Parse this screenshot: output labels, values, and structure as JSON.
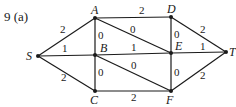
{
  "problem": {
    "label": "9  (a)"
  },
  "graph": {
    "line_color": "#1a1a1a",
    "nodes": [
      {
        "id": "S",
        "label": "S",
        "x": 38,
        "y": 56,
        "lx": 26,
        "ly": 60
      },
      {
        "id": "A",
        "label": "A",
        "x": 95,
        "y": 18,
        "lx": 91,
        "ly": 14
      },
      {
        "id": "B",
        "label": "B",
        "x": 95,
        "y": 55,
        "lx": 100,
        "ly": 52
      },
      {
        "id": "C",
        "label": "C",
        "x": 95,
        "y": 91,
        "lx": 90,
        "ly": 104
      },
      {
        "id": "D",
        "label": "D",
        "x": 171,
        "y": 17,
        "lx": 167,
        "ly": 13
      },
      {
        "id": "E",
        "label": "E",
        "x": 171,
        "y": 53,
        "lx": 175,
        "ly": 50
      },
      {
        "id": "F",
        "label": "F",
        "x": 171,
        "y": 91,
        "lx": 166,
        "ly": 104
      },
      {
        "id": "T",
        "label": "T",
        "x": 226,
        "y": 52,
        "lx": 229,
        "ly": 56
      }
    ],
    "edges": [
      {
        "from": "S",
        "to": "A",
        "weight": "2",
        "lx": 60,
        "ly": 33
      },
      {
        "from": "S",
        "to": "B",
        "weight": "1",
        "lx": 62,
        "ly": 52
      },
      {
        "from": "S",
        "to": "C",
        "weight": "2",
        "lx": 61,
        "ly": 81
      },
      {
        "from": "A",
        "to": "D",
        "weight": "2",
        "lx": 139,
        "ly": 14
      },
      {
        "from": "A",
        "to": "B",
        "weight": "0",
        "lx": 98,
        "ly": 39
      },
      {
        "from": "A",
        "to": "E",
        "weight": "0",
        "lx": 130,
        "ly": 33
      },
      {
        "from": "B",
        "to": "E",
        "weight": "1",
        "lx": 131,
        "ly": 51
      },
      {
        "from": "B",
        "to": "C",
        "weight": "0",
        "lx": 98,
        "ly": 76
      },
      {
        "from": "B",
        "to": "F",
        "weight": "0",
        "lx": 131,
        "ly": 69
      },
      {
        "from": "C",
        "to": "F",
        "weight": "2",
        "lx": 131,
        "ly": 101
      },
      {
        "from": "D",
        "to": "E",
        "weight": "0",
        "lx": 174,
        "ly": 38
      },
      {
        "from": "D",
        "to": "T",
        "weight": "2",
        "lx": 200,
        "ly": 33
      },
      {
        "from": "E",
        "to": "T",
        "weight": "1",
        "lx": 200,
        "ly": 50
      },
      {
        "from": "E",
        "to": "F",
        "weight": "0",
        "lx": 174,
        "ly": 76
      },
      {
        "from": "F",
        "to": "T",
        "weight": "2",
        "lx": 200,
        "ly": 79
      }
    ]
  }
}
